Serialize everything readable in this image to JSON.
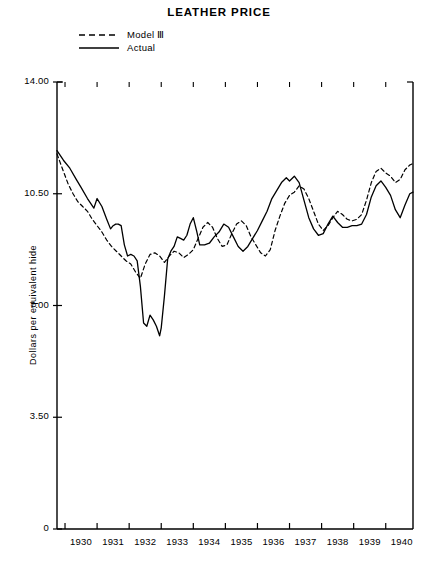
{
  "title": "LEATHER PRICE",
  "legend": {
    "position": "top-left",
    "items": [
      {
        "label": "Model Ⅲ",
        "style": "dashed",
        "name": "model-iii"
      },
      {
        "label": "Actual",
        "style": "solid",
        "name": "actual"
      }
    ]
  },
  "axes": {
    "ylabel": "Dollars per equivalent hide",
    "xlabel": "",
    "yticks": [
      "14.00",
      "10.50",
      "7.00",
      "3.50",
      "0"
    ],
    "ytick_values": [
      14.0,
      10.5,
      7.0,
      3.5,
      0
    ],
    "ylim": [
      0,
      14.0
    ],
    "xticks": [
      "1930",
      "1931",
      "1932",
      "1933",
      "1934",
      "1935",
      "1936",
      "1937",
      "1938",
      "1939",
      "1940"
    ],
    "xlim": [
      1929.75,
      1940.85
    ],
    "grid": false
  },
  "chart_data": {
    "type": "line",
    "title": "LEATHER PRICE",
    "xlabel": "",
    "ylabel": "Dollars per equivalent hide",
    "ylim": [
      0,
      14.0
    ],
    "xlim": [
      1929.75,
      1940.85
    ],
    "grid": false,
    "legend_position": "top-left",
    "series": [
      {
        "name": "Actual",
        "style": "solid",
        "x": [
          1929.75,
          1929.95,
          1930.15,
          1930.35,
          1930.5,
          1930.7,
          1930.9,
          1931.0,
          1931.15,
          1931.3,
          1931.42,
          1931.5,
          1931.58,
          1931.66,
          1931.75,
          1931.85,
          1931.95,
          1932.05,
          1932.15,
          1932.25,
          1932.35,
          1932.45,
          1932.55,
          1932.65,
          1932.75,
          1932.85,
          1932.95,
          1933.0,
          1933.1,
          1933.2,
          1933.3,
          1933.4,
          1933.5,
          1933.6,
          1933.7,
          1933.8,
          1933.9,
          1934.0,
          1934.1,
          1934.2,
          1934.35,
          1934.5,
          1934.65,
          1934.8,
          1934.95,
          1935.1,
          1935.25,
          1935.4,
          1935.55,
          1935.7,
          1935.85,
          1936.0,
          1936.15,
          1936.3,
          1936.45,
          1936.6,
          1936.75,
          1936.9,
          1937.0,
          1937.15,
          1937.3,
          1937.45,
          1937.6,
          1937.75,
          1937.9,
          1938.05,
          1938.2,
          1938.35,
          1938.5,
          1938.65,
          1938.8,
          1938.95,
          1939.1,
          1939.25,
          1939.4,
          1939.55,
          1939.7,
          1939.85,
          1940.0,
          1940.15,
          1940.3,
          1940.45,
          1940.6,
          1940.75,
          1940.85
        ],
        "y": [
          11.85,
          11.55,
          11.3,
          10.95,
          10.7,
          10.35,
          10.05,
          10.35,
          10.1,
          9.7,
          9.4,
          9.5,
          9.55,
          9.55,
          9.5,
          8.9,
          8.55,
          8.6,
          8.55,
          8.4,
          7.6,
          6.45,
          6.35,
          6.7,
          6.55,
          6.35,
          6.05,
          6.3,
          7.3,
          8.45,
          8.7,
          8.85,
          9.15,
          9.1,
          9.05,
          9.2,
          9.55,
          9.75,
          9.35,
          8.9,
          8.9,
          8.95,
          9.15,
          9.3,
          9.55,
          9.45,
          9.15,
          8.85,
          8.7,
          8.85,
          9.1,
          9.35,
          9.65,
          9.95,
          10.35,
          10.6,
          10.85,
          11.0,
          10.9,
          11.05,
          10.85,
          10.3,
          9.75,
          9.4,
          9.2,
          9.25,
          9.55,
          9.8,
          9.6,
          9.45,
          9.45,
          9.5,
          9.5,
          9.55,
          9.85,
          10.4,
          10.75,
          10.9,
          10.7,
          10.45,
          10.0,
          9.75,
          10.15,
          10.5,
          10.55
        ]
      },
      {
        "name": "Model III",
        "style": "dashed",
        "x": [
          1929.75,
          1929.95,
          1930.1,
          1930.25,
          1930.4,
          1930.55,
          1930.7,
          1930.85,
          1931.0,
          1931.15,
          1931.3,
          1931.45,
          1931.6,
          1931.75,
          1931.9,
          1932.05,
          1932.2,
          1932.35,
          1932.5,
          1932.65,
          1932.8,
          1932.95,
          1933.1,
          1933.25,
          1933.4,
          1933.55,
          1933.7,
          1933.85,
          1934.0,
          1934.15,
          1934.3,
          1934.45,
          1934.6,
          1934.75,
          1934.9,
          1935.05,
          1935.2,
          1935.35,
          1935.5,
          1935.65,
          1935.8,
          1935.95,
          1936.1,
          1936.25,
          1936.4,
          1936.55,
          1936.7,
          1936.85,
          1937.0,
          1937.15,
          1937.3,
          1937.45,
          1937.6,
          1937.75,
          1937.9,
          1938.05,
          1938.2,
          1938.35,
          1938.5,
          1938.65,
          1938.8,
          1938.95,
          1939.1,
          1939.25,
          1939.4,
          1939.55,
          1939.7,
          1939.85,
          1940.0,
          1940.15,
          1940.3,
          1940.45,
          1940.6,
          1940.75,
          1940.85
        ],
        "y": [
          11.75,
          11.2,
          10.8,
          10.5,
          10.25,
          10.1,
          9.95,
          9.7,
          9.5,
          9.3,
          9.05,
          8.85,
          8.7,
          8.55,
          8.4,
          8.3,
          8.05,
          7.85,
          8.3,
          8.6,
          8.65,
          8.55,
          8.35,
          8.55,
          8.7,
          8.65,
          8.5,
          8.6,
          8.75,
          9.1,
          9.45,
          9.6,
          9.45,
          9.1,
          8.85,
          8.9,
          9.25,
          9.55,
          9.65,
          9.5,
          9.15,
          8.9,
          8.65,
          8.55,
          8.75,
          9.35,
          9.8,
          10.2,
          10.45,
          10.55,
          10.75,
          10.65,
          10.35,
          9.95,
          9.55,
          9.35,
          9.5,
          9.75,
          9.95,
          9.85,
          9.7,
          9.65,
          9.7,
          9.85,
          10.3,
          10.85,
          11.2,
          11.3,
          11.15,
          11.05,
          10.85,
          10.95,
          11.25,
          11.4,
          11.45
        ]
      }
    ]
  },
  "plot_geometry": {
    "left": 57,
    "right": 413,
    "top": 82,
    "bottom": 529
  }
}
